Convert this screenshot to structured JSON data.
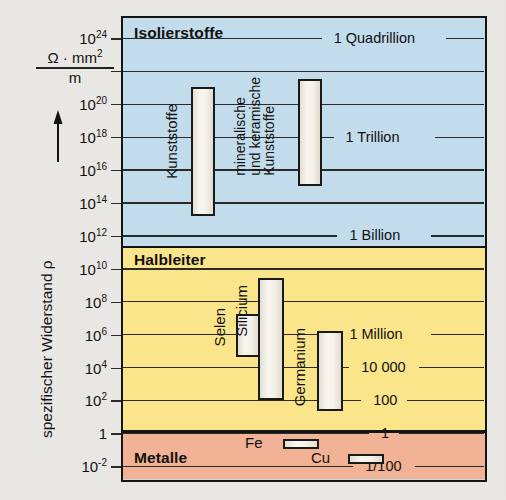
{
  "axis": {
    "title": "spezifischer Widerstand ρ",
    "unit_numerator": "Ω · mm",
    "unit_numerator_sup": "2",
    "unit_denominator": "m",
    "arrow": "up-arrow-icon",
    "ticks": [
      {
        "label_base": "10",
        "label_exp": "24",
        "exp10": 24
      },
      {
        "label_base": "10",
        "label_exp": "22",
        "exp10": 22
      },
      {
        "label_base": "10",
        "label_exp": "20",
        "exp10": 20
      },
      {
        "label_base": "10",
        "label_exp": "18",
        "exp10": 18
      },
      {
        "label_base": "10",
        "label_exp": "16",
        "exp10": 16
      },
      {
        "label_base": "10",
        "label_exp": "14",
        "exp10": 14
      },
      {
        "label_base": "10",
        "label_exp": "12",
        "exp10": 12
      },
      {
        "label_base": "10",
        "label_exp": "10",
        "exp10": 10
      },
      {
        "label_base": "10",
        "label_exp": "8",
        "exp10": 8
      },
      {
        "label_base": "10",
        "label_exp": "6",
        "exp10": 6
      },
      {
        "label_base": "10",
        "label_exp": "4",
        "exp10": 4
      },
      {
        "label_base": "10",
        "label_exp": "2",
        "exp10": 2
      },
      {
        "label_base": "1",
        "label_exp": "",
        "exp10": 0
      },
      {
        "label_base": "10",
        "label_exp": "-2",
        "exp10": -2
      }
    ]
  },
  "bands": [
    {
      "name": "Isolierstoffe",
      "color": "#c2dcec",
      "top_exp10": 25.2,
      "bottom_exp10": 11.3
    },
    {
      "name": "Halbleiter",
      "color": "#fbe58a",
      "top_exp10": 11.3,
      "bottom_exp10": 0.1
    },
    {
      "name": "Metalle",
      "color": "#f2b295",
      "top_exp10": 0.1,
      "bottom_exp10": -2.8
    }
  ],
  "value_labels": [
    {
      "text": "1 Quadrillion",
      "exp10": 24
    },
    {
      "text": "1 Trillion",
      "exp10": 18
    },
    {
      "text": "1 Billion",
      "exp10": 12
    },
    {
      "text": "1 Million",
      "exp10": 6
    },
    {
      "text": "10 000",
      "exp10": 4
    },
    {
      "text": "100",
      "exp10": 2
    },
    {
      "text": "1",
      "exp10": 0
    },
    {
      "text": "1/100",
      "exp10": -2
    }
  ],
  "bars": [
    {
      "material": "Kunststoffe",
      "top_exp10": 21.0,
      "bottom_exp10": 13.2,
      "label_lines": [
        "Kunststoffe"
      ]
    },
    {
      "material": "mineralische und keramische Kunststoffe",
      "top_exp10": 21.5,
      "bottom_exp10": 15.0,
      "label_lines": [
        "mineralische",
        "und keramische",
        "Kunststoffe"
      ]
    },
    {
      "material": "Selen",
      "top_exp10": 7.2,
      "bottom_exp10": 4.6,
      "label_lines": [
        "Selen"
      ]
    },
    {
      "material": "Silicium",
      "top_exp10": 9.4,
      "bottom_exp10": 2.0,
      "label_lines": [
        "Silicium"
      ]
    },
    {
      "material": "Germanium",
      "top_exp10": 6.2,
      "bottom_exp10": 1.3,
      "label_lines": [
        "Germanium"
      ]
    }
  ],
  "metal_bars": [
    {
      "material": "Fe",
      "exp10": -0.7
    },
    {
      "material": "Cu",
      "exp10": -1.6
    }
  ],
  "chart_data": {
    "type": "bar",
    "ylabel": "spezifischer Widerstand ρ",
    "yunit": "Ω · mm² / m",
    "yscale": "log",
    "ylim_exp10": [
      -2.8,
      25.2
    ],
    "grid": true,
    "legend": "none",
    "ytick_labels": [
      "10^24",
      "10^22",
      "10^20",
      "10^18",
      "10^16",
      "10^14",
      "10^12",
      "10^10",
      "10^8",
      "10^6",
      "10^4",
      "10^2",
      "1",
      "10^-2"
    ],
    "secondary_labels": [
      "1 Quadrillion",
      "1 Trillion",
      "1 Billion",
      "1 Million",
      "10 000",
      "100",
      "1",
      "1/100"
    ],
    "categories": [
      "Kunststoffe",
      "mineralische und keramische Kunststoffe",
      "Selen",
      "Silicium",
      "Germanium",
      "Fe",
      "Cu"
    ],
    "ranges_exp10": [
      [
        13.2,
        21.0
      ],
      [
        15.0,
        21.5
      ],
      [
        4.6,
        7.2
      ],
      [
        2.0,
        9.4
      ],
      [
        1.3,
        6.2
      ],
      [
        -0.7,
        -0.7
      ],
      [
        -1.6,
        -1.6
      ]
    ],
    "groups": [
      "Isolierstoffe",
      "Isolierstoffe",
      "Halbleiter",
      "Halbleiter",
      "Halbleiter",
      "Metalle",
      "Metalle"
    ]
  }
}
